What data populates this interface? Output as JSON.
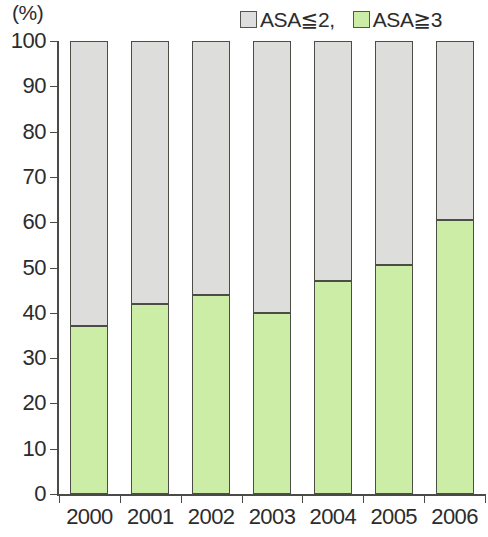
{
  "chart_data": {
    "type": "bar",
    "stacked": true,
    "title": "",
    "subtitle": "",
    "xlabel": "(年)",
    "ylabel": "(%)",
    "categories": [
      "2000",
      "2001",
      "2002",
      "2003",
      "2004",
      "2005",
      "2006"
    ],
    "series": [
      {
        "name": "ASA≧3",
        "color": "#cbeda6",
        "values": [
          37.0,
          42.0,
          44.0,
          40.0,
          47.0,
          50.5,
          60.5
        ]
      },
      {
        "name": "ASA≦2,",
        "color": "#dddddb",
        "values": [
          63.0,
          58.0,
          56.0,
          60.0,
          53.0,
          49.5,
          39.5
        ]
      }
    ],
    "ylim": [
      0,
      100
    ],
    "yticks": [
      0,
      10,
      20,
      30,
      40,
      50,
      60,
      70,
      80,
      90,
      100
    ],
    "ytick_labels": [
      "0",
      "10",
      "20",
      "30",
      "40",
      "50",
      "60",
      "70",
      "80",
      "90",
      "100"
    ],
    "grid": false,
    "legend_position": "top-right"
  },
  "legend": {
    "entries": [
      {
        "label": "ASA≦2,",
        "swatch": "gray"
      },
      {
        "label": "ASA≧3",
        "swatch": "green"
      }
    ]
  },
  "axes": {
    "y_unit": "(%)",
    "x_unit": "(年)"
  }
}
